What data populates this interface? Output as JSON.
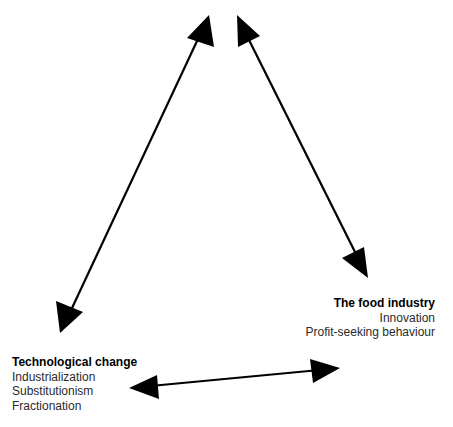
{
  "diagram": {
    "type": "triangle-relationship",
    "nodes": {
      "top": {
        "title": "",
        "items": []
      },
      "bottom_left": {
        "title": "Technological change",
        "items": [
          "Industrialization",
          "Substitutionism",
          "Fractionation"
        ]
      },
      "bottom_right": {
        "title": "The food industry",
        "items": [
          "Innovation",
          "Profit-seeking behaviour"
        ]
      }
    },
    "edges": [
      {
        "from": "top",
        "to": "bottom_left",
        "style": "double-arrow"
      },
      {
        "from": "top",
        "to": "bottom_right",
        "style": "double-arrow"
      },
      {
        "from": "bottom_left",
        "to": "bottom_right",
        "style": "double-arrow"
      }
    ],
    "colors": {
      "arrow": "#000000",
      "background": "#ffffff",
      "text": "#1a1a1a"
    }
  }
}
